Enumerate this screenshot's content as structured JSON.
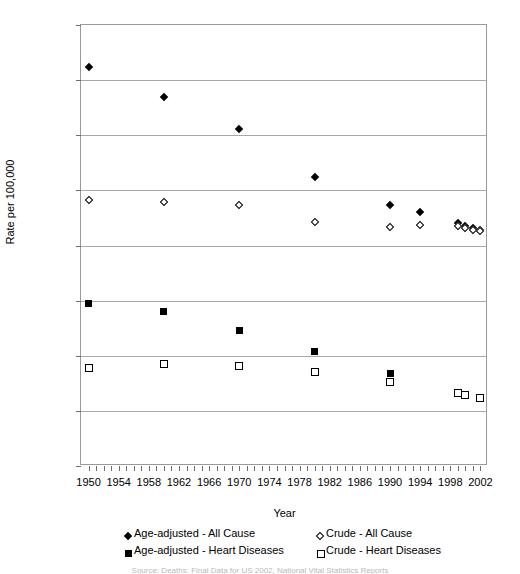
{
  "chart_data": {
    "type": "scatter",
    "title": "",
    "xlabel": "Year",
    "ylabel": "Rate per 100,000",
    "xlim": [
      1949,
      2003
    ],
    "ylim": [
      0,
      1600
    ],
    "grid": true,
    "legend_position": "bottom",
    "y_ticks": [
      0,
      200,
      400,
      600,
      800,
      1000,
      1200,
      1400,
      1600
    ],
    "x_ticks": [
      1950,
      1954,
      1958,
      1962,
      1966,
      1970,
      1974,
      1978,
      1982,
      1986,
      1990,
      1994,
      1998,
      2002
    ],
    "x_minor_tick_step": 1,
    "series": [
      {
        "name": "Age-adjusted - All Cause",
        "marker": "filled-diamond",
        "color": "#000000",
        "points": [
          {
            "x": 1950,
            "y": 1446
          },
          {
            "x": 1960,
            "y": 1339
          },
          {
            "x": 1970,
            "y": 1223
          },
          {
            "x": 1980,
            "y": 1048
          },
          {
            "x": 1990,
            "y": 948
          },
          {
            "x": 1994,
            "y": 920
          },
          {
            "x": 1999,
            "y": 881
          },
          {
            "x": 2000,
            "y": 872
          },
          {
            "x": 2001,
            "y": 863
          },
          {
            "x": 2002,
            "y": 856
          }
        ]
      },
      {
        "name": "Crude - All Cause",
        "marker": "open-diamond",
        "color": "#000000",
        "points": [
          {
            "x": 1950,
            "y": 964
          },
          {
            "x": 1960,
            "y": 957
          },
          {
            "x": 1970,
            "y": 948
          },
          {
            "x": 1980,
            "y": 884
          },
          {
            "x": 1990,
            "y": 866
          },
          {
            "x": 1994,
            "y": 875
          },
          {
            "x": 1999,
            "y": 870
          },
          {
            "x": 2000,
            "y": 864
          },
          {
            "x": 2001,
            "y": 858
          },
          {
            "x": 2002,
            "y": 853
          }
        ]
      },
      {
        "name": "Age-adjusted - Heart Diseases",
        "marker": "filled-square",
        "color": "#000000",
        "points": [
          {
            "x": 1950,
            "y": 588
          },
          {
            "x": 1960,
            "y": 559
          },
          {
            "x": 1970,
            "y": 493
          },
          {
            "x": 1980,
            "y": 415
          },
          {
            "x": 1990,
            "y": 335
          },
          {
            "x": 1999,
            "y": 267
          },
          {
            "x": 2000,
            "y": 258
          },
          {
            "x": 2002,
            "y": 247
          }
        ]
      },
      {
        "name": "Crude - Heart Diseases",
        "marker": "open-square",
        "color": "#000000",
        "points": [
          {
            "x": 1950,
            "y": 355
          },
          {
            "x": 1960,
            "y": 369
          },
          {
            "x": 1970,
            "y": 362
          },
          {
            "x": 1980,
            "y": 340
          },
          {
            "x": 1990,
            "y": 305
          },
          {
            "x": 1999,
            "y": 266
          },
          {
            "x": 2000,
            "y": 258
          },
          {
            "x": 2002,
            "y": 245
          }
        ]
      }
    ]
  },
  "axes": {
    "y_title": "Rate per 100,000",
    "x_title": "Year"
  },
  "legend": {
    "items": [
      {
        "label": "Age-adjusted - All Cause",
        "marker": "filled-diamond"
      },
      {
        "label": "Crude - All Cause",
        "marker": "open-diamond"
      },
      {
        "label": "Age-adjusted - Heart Diseases",
        "marker": "filled-square"
      },
      {
        "label": "Crude - Heart Diseases",
        "marker": "open-square"
      }
    ]
  },
  "caption": {
    "text": "Source: Deaths: Final Data for US 2002, National Vital Statistics Reports"
  }
}
